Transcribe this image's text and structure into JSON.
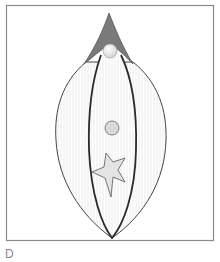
{
  "figure": {
    "panel_label": "D",
    "colors": {
      "frame": "#8a8a8a",
      "cap_fill": "#7a7a7a",
      "cap_stroke": "#555555",
      "outline": "#444444",
      "inner_outline": "#2a2a2a",
      "hatch": "#e6e6e6",
      "sphere_fill": "#f2f2f2",
      "circle_fill": "#d9d9d9",
      "star_fill": "#e4e4e4"
    }
  }
}
